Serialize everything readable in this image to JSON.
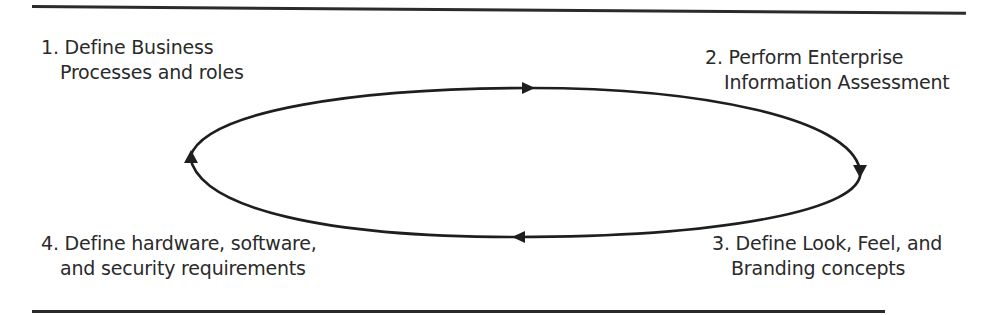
{
  "diagram": {
    "type": "cycle",
    "direction": "clockwise",
    "steps": [
      {
        "number": "1.",
        "line1": "1. Define Business",
        "line2": "Processes and roles",
        "position": "top-left"
      },
      {
        "number": "2.",
        "line1": "2. Perform Enterprise",
        "line2": "Information Assessment",
        "position": "top-right"
      },
      {
        "number": "3.",
        "line1": "3. Define Look, Feel, and",
        "line2": "Branding concepts",
        "position": "bottom-right"
      },
      {
        "number": "4.",
        "line1": "4. Define hardware, software,",
        "line2": "and security requirements",
        "position": "bottom-left"
      }
    ],
    "arrows": [
      {
        "from": "1",
        "to": "2",
        "direction": "right",
        "location": "top"
      },
      {
        "from": "2",
        "to": "3",
        "direction": "down",
        "location": "right"
      },
      {
        "from": "3",
        "to": "4",
        "direction": "left",
        "location": "bottom"
      },
      {
        "from": "4",
        "to": "1",
        "direction": "up",
        "location": "left"
      }
    ],
    "colors": {
      "stroke": "#1e1e1e",
      "text": "#2a2a2a",
      "rule": "#2b2b2b",
      "background": "#ffffff"
    }
  }
}
